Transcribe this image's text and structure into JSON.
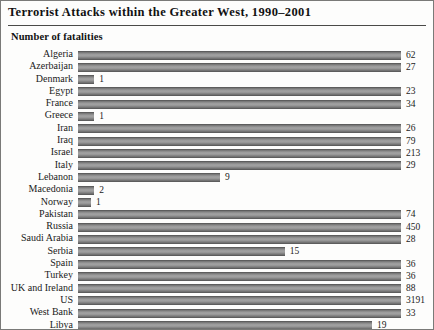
{
  "header": {
    "title": "Terrorist Attacks within the Greater West, 1990–2001",
    "subtitle": "Number of fatalities"
  },
  "style": {
    "bar_color_top": "#6f6f6f",
    "bar_color_mid": "#a3a3a3",
    "bar_color_bottom": "#6a6a6a",
    "border_color": "#7a7a78",
    "text_color": "#1a1a1a",
    "background": "#fdfdfc"
  },
  "chart_data": {
    "type": "bar",
    "orientation": "horizontal",
    "title": "Terrorist Attacks within the Greater West, 1990–2001",
    "xlabel": "",
    "ylabel": "",
    "value_label_heading": "Number of fatalities",
    "grid": false,
    "legend": null,
    "bar_axis_max": 100,
    "categories": [
      "Algeria",
      "Azerbaijan",
      "Denmark",
      "Egypt",
      "France",
      "Greece",
      "Iran",
      "Iraq",
      "Israel",
      "Italy",
      "Lebanon",
      "Macedonia",
      "Norway",
      "Pakistan",
      "Russia",
      "Saudi Arabia",
      "Serbia",
      "Spain",
      "Turkey",
      "UK and Ireland",
      "US",
      "West Bank",
      "Libya"
    ],
    "values": [
      100,
      100,
      5,
      100,
      100,
      5,
      100,
      100,
      100,
      100,
      44,
      5,
      4,
      100,
      100,
      100,
      64,
      100,
      100,
      100,
      100,
      100,
      91
    ],
    "value_labels": [
      "62",
      "27",
      "1",
      "23",
      "34",
      "1",
      "26",
      "79",
      "213",
      "29",
      "9",
      "2",
      "1",
      "74",
      "450",
      "28",
      "15",
      "36",
      "36",
      "88",
      "3191",
      "33",
      "19"
    ],
    "fatalities": [
      62,
      27,
      1,
      23,
      34,
      1,
      26,
      79,
      213,
      29,
      9,
      2,
      1,
      74,
      450,
      28,
      15,
      36,
      36,
      88,
      3191,
      33,
      19
    ],
    "rows": [
      {
        "label": "Algeria",
        "bar_pct": 100,
        "value": "62"
      },
      {
        "label": "Azerbaijan",
        "bar_pct": 100,
        "value": "27"
      },
      {
        "label": "Denmark",
        "bar_pct": 5,
        "value": "1"
      },
      {
        "label": "Egypt",
        "bar_pct": 100,
        "value": "23"
      },
      {
        "label": "France",
        "bar_pct": 100,
        "value": "34"
      },
      {
        "label": "Greece",
        "bar_pct": 5,
        "value": "1"
      },
      {
        "label": "Iran",
        "bar_pct": 100,
        "value": "26"
      },
      {
        "label": "Iraq",
        "bar_pct": 100,
        "value": "79"
      },
      {
        "label": "Israel",
        "bar_pct": 100,
        "value": "213"
      },
      {
        "label": "Italy",
        "bar_pct": 100,
        "value": "29"
      },
      {
        "label": "Lebanon",
        "bar_pct": 44,
        "value": "9"
      },
      {
        "label": "Macedonia",
        "bar_pct": 5,
        "value": "2"
      },
      {
        "label": "Norway",
        "bar_pct": 4,
        "value": "1"
      },
      {
        "label": "Pakistan",
        "bar_pct": 100,
        "value": "74"
      },
      {
        "label": "Russia",
        "bar_pct": 100,
        "value": "450"
      },
      {
        "label": "Saudi Arabia",
        "bar_pct": 100,
        "value": "28"
      },
      {
        "label": "Serbia",
        "bar_pct": 64,
        "value": "15"
      },
      {
        "label": "Spain",
        "bar_pct": 100,
        "value": "36"
      },
      {
        "label": "Turkey",
        "bar_pct": 100,
        "value": "36"
      },
      {
        "label": "UK and Ireland",
        "bar_pct": 100,
        "value": "88"
      },
      {
        "label": "US",
        "bar_pct": 100,
        "value": "3191"
      },
      {
        "label": "West Bank",
        "bar_pct": 100,
        "value": "33"
      },
      {
        "label": "Libya",
        "bar_pct": 91,
        "value": "19"
      }
    ]
  }
}
